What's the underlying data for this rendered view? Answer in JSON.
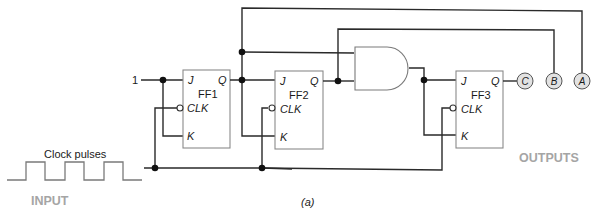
{
  "figure_label": "(a)",
  "input": {
    "title": "INPUT",
    "waveform_label": "Clock pulses",
    "pulse_count": 3
  },
  "outputs": {
    "title": "OUTPUTS",
    "terminals": [
      "C",
      "B",
      "A"
    ]
  },
  "constant_input": "1",
  "flip_flops": [
    {
      "name": "FF1",
      "pins": {
        "j": "J",
        "clk": "CLK",
        "k": "K",
        "q": "Q"
      }
    },
    {
      "name": "FF2",
      "pins": {
        "j": "J",
        "clk": "CLK",
        "k": "K",
        "q": "Q"
      }
    },
    {
      "name": "FF3",
      "pins": {
        "j": "J",
        "clk": "CLK",
        "k": "K",
        "q": "Q"
      }
    }
  ],
  "gates": [
    {
      "type": "AND",
      "inputs": [
        "FF1.Q",
        "FF2.Q"
      ],
      "output": "FF3.J,K"
    }
  ],
  "colors": {
    "wire": "#2a2a2a",
    "box_border": "#8a8a8a",
    "muted_label": "#a5a5a5",
    "output_terminal_fill": "#e2e2e2"
  }
}
